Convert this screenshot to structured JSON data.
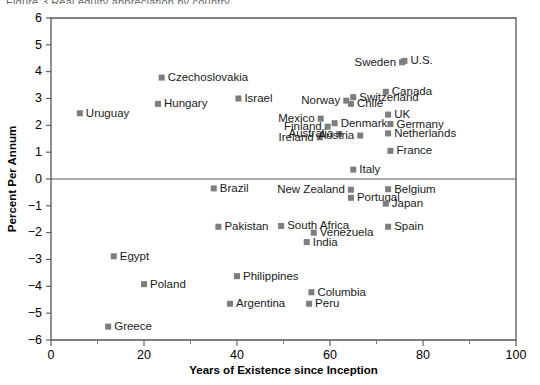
{
  "chart_data": {
    "type": "scatter",
    "title": "",
    "xlabel": "Years of Existence since Inception",
    "ylabel": "Percent Per Annum",
    "xlim": [
      0,
      100
    ],
    "ylim": [
      -6,
      6
    ],
    "xticks": [
      0,
      20,
      40,
      60,
      80,
      100
    ],
    "yticks": [
      6,
      5,
      4,
      3,
      2,
      1,
      0,
      -1,
      -2,
      -3,
      -4,
      -5,
      -6
    ],
    "xtick_labels": [
      "0",
      "20",
      "40",
      "60",
      "80",
      "100"
    ],
    "ytick_labels": [
      "6",
      "5",
      "4",
      "3",
      "2",
      "1",
      "0",
      "−1",
      "−2",
      "−3",
      "−4",
      "−5",
      "−6"
    ],
    "grid": false,
    "legend": "none",
    "zero_line": true,
    "marker_color": "#7d7d7d",
    "marker_shape": "square",
    "points": [
      {
        "label": "Uruguay",
        "x": 6.2,
        "y": 2.45,
        "side": "right"
      },
      {
        "label": "Hungary",
        "x": 23.0,
        "y": 2.8,
        "side": "right"
      },
      {
        "label": "Czechoslovakia",
        "x": 23.8,
        "y": 3.78,
        "side": "right"
      },
      {
        "label": "Israel",
        "x": 40.3,
        "y": 3.0,
        "side": "right"
      },
      {
        "label": "Mexico",
        "x": 58.0,
        "y": 2.25,
        "side": "left"
      },
      {
        "label": "Norway",
        "x": 63.5,
        "y": 2.92,
        "side": "left"
      },
      {
        "label": "Sweden",
        "x": 75.5,
        "y": 4.35,
        "side": "left"
      },
      {
        "label": "U.S.",
        "x": 76.0,
        "y": 4.4,
        "side": "right"
      },
      {
        "label": "Switzerland",
        "x": 65.0,
        "y": 3.05,
        "side": "right"
      },
      {
        "label": "Canada",
        "x": 72.0,
        "y": 3.25,
        "side": "right"
      },
      {
        "label": "Chile",
        "x": 64.5,
        "y": 2.8,
        "side": "right"
      },
      {
        "label": "UK",
        "x": 72.5,
        "y": 2.4,
        "side": "right"
      },
      {
        "label": "Denmark",
        "x": 61.0,
        "y": 2.08,
        "side": "right"
      },
      {
        "label": "Finland",
        "x": 59.5,
        "y": 1.95,
        "side": "left"
      },
      {
        "label": "Germany",
        "x": 73.0,
        "y": 2.05,
        "side": "right"
      },
      {
        "label": "Netherlands",
        "x": 72.5,
        "y": 1.7,
        "side": "right"
      },
      {
        "label": "Ireland",
        "x": 57.8,
        "y": 1.55,
        "side": "left"
      },
      {
        "label": "Australia",
        "x": 62.0,
        "y": 1.68,
        "side": "left"
      },
      {
        "label": "Austria",
        "x": 66.5,
        "y": 1.62,
        "side": "left"
      },
      {
        "label": "France",
        "x": 73.0,
        "y": 1.05,
        "side": "right"
      },
      {
        "label": "Italy",
        "x": 65.0,
        "y": 0.35,
        "side": "right"
      },
      {
        "label": "Brazil",
        "x": 35.0,
        "y": -0.35,
        "side": "right"
      },
      {
        "label": "New Zealand",
        "x": 64.5,
        "y": -0.4,
        "side": "left"
      },
      {
        "label": "Portugal",
        "x": 64.5,
        "y": -0.7,
        "side": "right"
      },
      {
        "label": "Belgium",
        "x": 72.5,
        "y": -0.38,
        "side": "right"
      },
      {
        "label": "Japan",
        "x": 72.0,
        "y": -0.92,
        "side": "right"
      },
      {
        "label": "Pakistan",
        "x": 36.0,
        "y": -1.78,
        "side": "right"
      },
      {
        "label": "South Africa",
        "x": 49.5,
        "y": -1.75,
        "side": "right"
      },
      {
        "label": "Venezuela",
        "x": 56.5,
        "y": -2.0,
        "side": "right"
      },
      {
        "label": "India",
        "x": 55.0,
        "y": -2.35,
        "side": "right"
      },
      {
        "label": "Spain",
        "x": 72.5,
        "y": -1.78,
        "side": "right"
      },
      {
        "label": "Egypt",
        "x": 13.5,
        "y": -2.88,
        "side": "right"
      },
      {
        "label": "Poland",
        "x": 20.0,
        "y": -3.92,
        "side": "right"
      },
      {
        "label": "Philippines",
        "x": 40.0,
        "y": -3.62,
        "side": "right"
      },
      {
        "label": "Columbia",
        "x": 56.0,
        "y": -4.22,
        "side": "right"
      },
      {
        "label": "Argentina",
        "x": 38.5,
        "y": -4.65,
        "side": "right"
      },
      {
        "label": "Peru",
        "x": 55.5,
        "y": -4.65,
        "side": "right"
      },
      {
        "label": "Greece",
        "x": 12.3,
        "y": -5.5,
        "side": "right"
      }
    ]
  },
  "header": {
    "cutoff_text": "Figure 3  Real equity appreciation by country"
  }
}
